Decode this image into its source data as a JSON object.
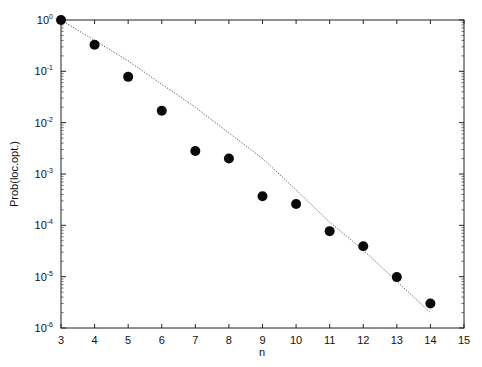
{
  "chart_data": {
    "type": "scatter",
    "title": "",
    "xlabel": "n",
    "ylabel": "Prob(loc.opt.)",
    "xlim": [
      3,
      15
    ],
    "ylim": [
      1e-06,
      1
    ],
    "yscale": "log",
    "grid": false,
    "legend": null,
    "x_ticks": [
      3,
      4,
      5,
      6,
      7,
      8,
      9,
      10,
      11,
      12,
      13,
      14,
      15
    ],
    "y_ticks": [
      {
        "exp": "0",
        "value": 1
      },
      {
        "exp": "-1",
        "value": 0.1
      },
      {
        "exp": "-2",
        "value": 0.01
      },
      {
        "exp": "-3",
        "value": 0.001
      },
      {
        "exp": "-4",
        "value": 0.0001
      },
      {
        "exp": "-5",
        "value": 1e-05
      },
      {
        "exp": "-6",
        "value": 1e-06
      }
    ],
    "series": [
      {
        "name": "measured",
        "style": "filled-circle",
        "x": [
          3,
          4,
          5,
          6,
          7,
          8,
          9,
          10,
          11,
          12,
          13,
          14
        ],
        "y": [
          1.0,
          0.33,
          0.078,
          0.017,
          0.0028,
          0.002,
          0.00037,
          0.00026,
          7.7e-05,
          3.9e-05,
          9.8e-06,
          3e-06
        ]
      },
      {
        "name": "fit",
        "style": "dotted-line",
        "x": [
          3,
          4,
          5,
          6,
          7,
          8,
          9,
          10,
          11,
          12,
          13,
          14
        ],
        "y": [
          1.0,
          0.4,
          0.16,
          0.056,
          0.02,
          0.0063,
          0.002,
          0.00049,
          0.000115,
          3.3e-05,
          8.1e-06,
          2e-06
        ]
      }
    ]
  }
}
